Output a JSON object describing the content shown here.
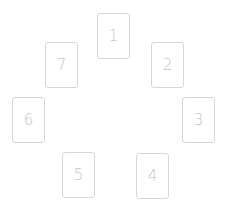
{
  "cards": [
    {
      "label": "1",
      "x": 97,
      "y": 13
    },
    {
      "label": "2",
      "x": 151,
      "y": 42
    },
    {
      "label": "3",
      "x": 182,
      "y": 97
    },
    {
      "label": "4",
      "x": 136,
      "y": 153
    },
    {
      "label": "5",
      "x": 62,
      "y": 152
    },
    {
      "label": "6",
      "x": 12,
      "y": 97
    },
    {
      "label": "7",
      "x": 45,
      "y": 42
    }
  ],
  "colors": {
    "border": "#d6d6d6",
    "text": "#c4c4c4",
    "background": "#ffffff"
  }
}
